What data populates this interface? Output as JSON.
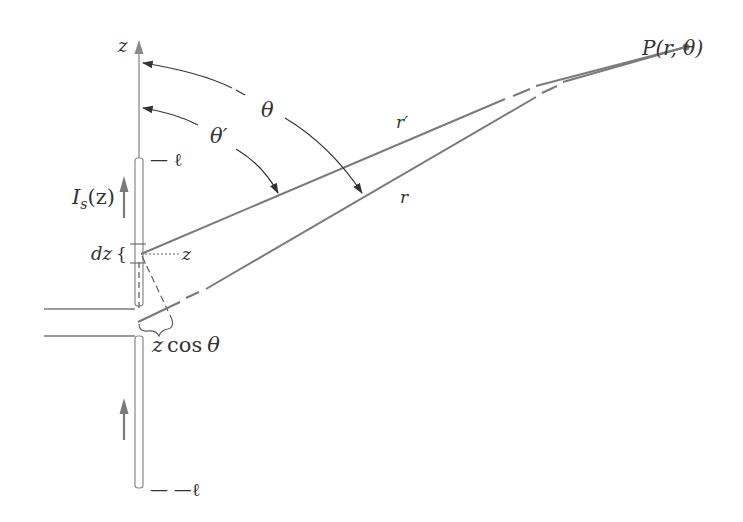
{
  "figure": {
    "colors": {
      "line": "#7a7a7a",
      "arrow": "#333333",
      "text": "#333333",
      "background": "#ffffff"
    },
    "labels": {
      "z_axis": "z",
      "theta": "θ",
      "theta_prime": "θ′",
      "top_end": "— ℓ",
      "bottom_end": "— —ℓ",
      "current": "I",
      "current_sub": "s",
      "current_arg": "(z)",
      "dz": "dz",
      "dz_brace": "{",
      "z_marker": "z",
      "r_prime": "r′",
      "r": "r",
      "z_cos_theta_z": "z",
      "z_cos_theta_cos": "cos",
      "z_cos_theta_theta": "θ",
      "point": "P(r, θ)"
    }
  }
}
